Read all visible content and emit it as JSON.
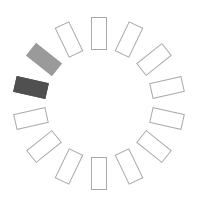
{
  "spinner": {
    "label": "loading-spinner",
    "segment_count": 14,
    "center": [
      99,
      103
    ],
    "radius": 70,
    "colors": {
      "outline": "#a9a9a9",
      "idle_fill": "#ffffff",
      "active_fill": "#505050",
      "trail_fill": "#9a9a9a"
    },
    "active_index": 11,
    "trail_index": 12
  }
}
